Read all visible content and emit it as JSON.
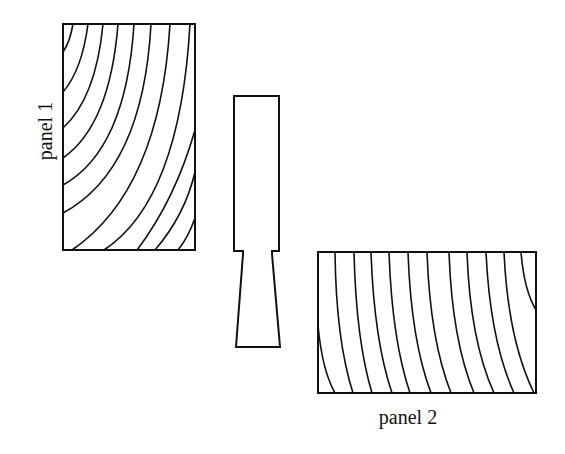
{
  "diagram": {
    "labels": {
      "panel1": "panel 1",
      "panel2": "panel 2"
    },
    "colors": {
      "stroke": "#111111",
      "background": "#ffffff"
    },
    "elements": [
      {
        "id": "panel-1",
        "shape": "rectangle",
        "grain": "curved arcs from upper-left",
        "x": 63,
        "y": 24,
        "w": 132,
        "h": 226
      },
      {
        "id": "connector",
        "shape": "stepped tapered key",
        "x": 234,
        "y": 96,
        "w": 47,
        "h": 251
      },
      {
        "id": "panel-2",
        "shape": "rectangle",
        "grain": "near-vertical slightly curved lines",
        "x": 318,
        "y": 252,
        "w": 218,
        "h": 141
      }
    ]
  }
}
